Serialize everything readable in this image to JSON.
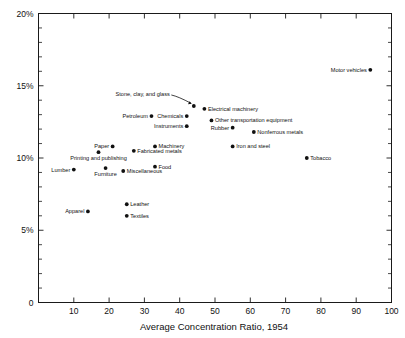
{
  "chart_data": {
    "type": "scatter",
    "title": "",
    "xlabel": "Average Concentration Ratio, 1954",
    "ylabel": "",
    "xlim": [
      0,
      100
    ],
    "ylim": [
      0,
      20
    ],
    "grid": false,
    "legend": "none",
    "x_ticks": [
      10,
      20,
      30,
      40,
      50,
      60,
      70,
      80,
      90,
      100
    ],
    "x_tick_labels": [
      "10",
      "20",
      "30",
      "40",
      "50",
      "60",
      "70",
      "80",
      "90",
      "100"
    ],
    "y_ticks": [
      0,
      5,
      10,
      15,
      20
    ],
    "y_tick_labels": [
      "0",
      "5%",
      "10%",
      "15%",
      "20%"
    ],
    "y_minor_tick_step": 1,
    "point_color": "#111111",
    "points": [
      {
        "label": "Motor vehicles",
        "x": 94,
        "y": 16.1,
        "label_pos": "left"
      },
      {
        "label": "Stone, clay, and glass",
        "x": 44,
        "y": 13.6,
        "label_pos": "leader"
      },
      {
        "label": "Electrical machinery",
        "x": 47,
        "y": 13.4,
        "label_pos": "right"
      },
      {
        "label": "Chemicals",
        "x": 42,
        "y": 12.9,
        "label_pos": "left"
      },
      {
        "label": "Petroleum",
        "x": 32,
        "y": 12.9,
        "label_pos": "left"
      },
      {
        "label": "Other transportation equipment",
        "x": 49,
        "y": 12.6,
        "label_pos": "right"
      },
      {
        "label": "Instruments",
        "x": 42,
        "y": 12.2,
        "label_pos": "left"
      },
      {
        "label": "Rubber",
        "x": 55,
        "y": 12.1,
        "label_pos": "left"
      },
      {
        "label": "Nonferrous metals",
        "x": 61,
        "y": 11.8,
        "label_pos": "right"
      },
      {
        "label": "Paper",
        "x": 21,
        "y": 10.8,
        "label_pos": "left"
      },
      {
        "label": "Machinery",
        "x": 33,
        "y": 10.8,
        "label_pos": "right"
      },
      {
        "label": "Iron and steel",
        "x": 55,
        "y": 10.8,
        "label_pos": "right"
      },
      {
        "label": "Fabricated metals",
        "x": 27,
        "y": 10.5,
        "label_pos": "right"
      },
      {
        "label": "Printing and publishing",
        "x": 17,
        "y": 10.4,
        "label_pos": "below"
      },
      {
        "label": "Tobacco",
        "x": 76,
        "y": 10.0,
        "label_pos": "right"
      },
      {
        "label": "Food",
        "x": 33,
        "y": 9.4,
        "label_pos": "right"
      },
      {
        "label": "Furniture",
        "x": 19,
        "y": 9.3,
        "label_pos": "below"
      },
      {
        "label": "Lumber",
        "x": 10,
        "y": 9.2,
        "label_pos": "left"
      },
      {
        "label": "Miscellaneous",
        "x": 24,
        "y": 9.1,
        "label_pos": "right"
      },
      {
        "label": "Leather",
        "x": 25,
        "y": 6.8,
        "label_pos": "right"
      },
      {
        "label": "Apparel",
        "x": 14,
        "y": 6.3,
        "label_pos": "left"
      },
      {
        "label": "Textiles",
        "x": 25,
        "y": 6.0,
        "label_pos": "right"
      }
    ]
  }
}
